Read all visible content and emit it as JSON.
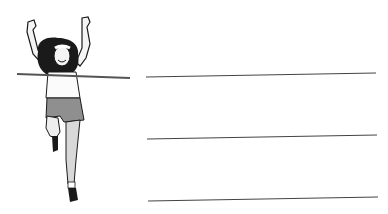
{
  "illustration": {
    "subject": "runner-crossing-finish-line",
    "colors": {
      "ink": "#1a1a1a",
      "skin": "#f2f2f2",
      "shorts": "#8a8a8a",
      "tape": "#555555"
    }
  },
  "writing_lines": {
    "count": 3,
    "color": "#444444",
    "lines": [
      {
        "x1": 146,
        "y1": 77,
        "x2": 376,
        "y2": 73
      },
      {
        "x1": 147,
        "y1": 139,
        "x2": 377,
        "y2": 135
      },
      {
        "x1": 148,
        "y1": 201,
        "x2": 378,
        "y2": 197
      }
    ]
  }
}
